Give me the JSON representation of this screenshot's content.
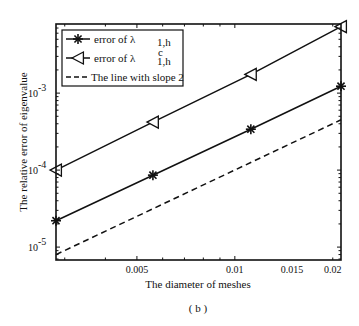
{
  "chart_data": {
    "type": "line",
    "title": "",
    "caption": "( b )",
    "xlabel": "The diameter of meshes",
    "ylabel": "The relative error of eigenvalue",
    "xscale": "log",
    "yscale": "log",
    "xlim": [
      0.00282,
      0.0212
    ],
    "ylim": [
      6.8e-06,
      0.0079
    ],
    "grid": false,
    "legend_position": "upper left",
    "x_ticks": [
      {
        "value": 0.005,
        "label": "0.005"
      },
      {
        "value": 0.01,
        "label": "0.01"
      },
      {
        "value": 0.015,
        "label": "0.015"
      },
      {
        "value": 0.02,
        "label": "0.02"
      }
    ],
    "y_ticks": [
      {
        "value": 0.001,
        "base": "10",
        "exp": "-3"
      },
      {
        "value": 0.0001,
        "base": "10",
        "exp": "-4"
      },
      {
        "value": 1e-05,
        "base": "10",
        "exp": "-5"
      }
    ],
    "series": [
      {
        "name": "error of λ1,h",
        "label_main": "error of λ",
        "label_sub": "1,h",
        "label_sup": "",
        "marker": "asterisk",
        "line": "solid",
        "x": [
          0.00282,
          0.0056,
          0.0112,
          0.0212
        ],
        "values": [
          2.2e-05,
          8.6e-05,
          0.00034,
          0.00123
        ]
      },
      {
        "name": "error of λc1,h",
        "label_main": "error of λ",
        "label_sub": "1,h",
        "label_sup": "c",
        "marker": "triangle-left",
        "line": "solid",
        "x": [
          0.00282,
          0.0056,
          0.0112,
          0.0212
        ],
        "values": [
          0.0001,
          0.00042,
          0.00175,
          0.0073
        ]
      },
      {
        "name": "The line with slope 2",
        "label_main": "The line with slope 2",
        "label_sub": "",
        "label_sup": "",
        "marker": "none",
        "line": "dashed",
        "x": [
          0.00282,
          0.0212
        ],
        "values": [
          8e-06,
          0.00045
        ]
      }
    ]
  }
}
